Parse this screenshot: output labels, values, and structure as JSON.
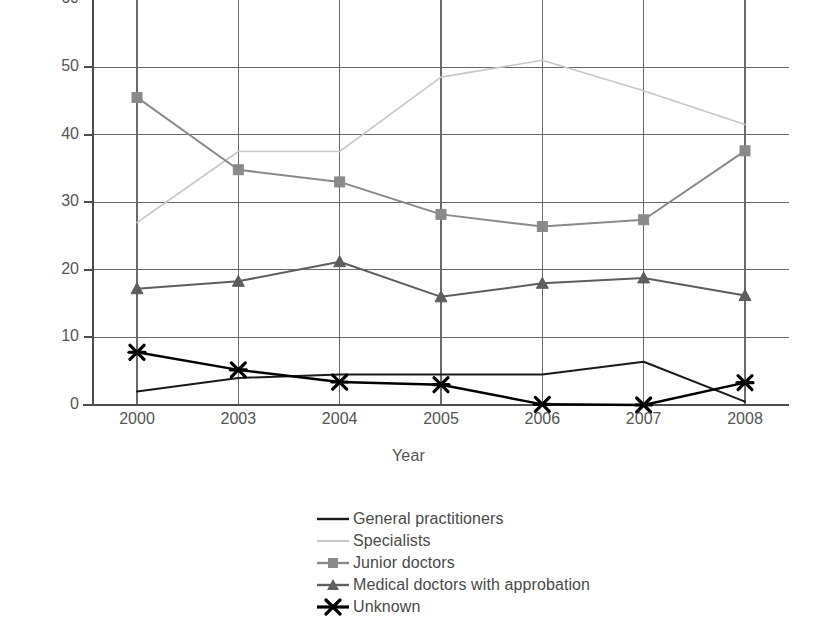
{
  "chart_data": {
    "type": "line",
    "title": "",
    "xlabel": "Year",
    "ylabel": "Percentage",
    "categories": [
      "2000",
      "2003",
      "2004",
      "2005",
      "2006",
      "2007",
      "2008"
    ],
    "ylim": [
      0,
      60
    ],
    "yticks": [
      0,
      10,
      20,
      30,
      40,
      50,
      60
    ],
    "ytick_labels": [
      "0",
      "10",
      "20",
      "30",
      "40",
      "50",
      "60"
    ],
    "grid": true,
    "grid_axis": "both",
    "legend_position": "bottom-center",
    "series": [
      {
        "name": "General practitioners",
        "color": "#1a1a1a",
        "marker": "none",
        "line_width": 2.0,
        "values": [
          2.0,
          4.0,
          4.5,
          4.5,
          4.5,
          6.4,
          0.5
        ]
      },
      {
        "name": "Specialists",
        "color": "#c8c8c8",
        "marker": "none",
        "line_width": 1.6,
        "values": [
          27.0,
          37.5,
          37.5,
          48.5,
          51.0,
          46.5,
          41.5
        ]
      },
      {
        "name": "Junior doctors",
        "color": "#8a8a8a",
        "marker": "square",
        "line_width": 2.0,
        "values": [
          45.5,
          34.8,
          33.0,
          28.2,
          26.4,
          27.4,
          37.6
        ]
      },
      {
        "name": "Medical doctors with approbation",
        "color": "#5e5e5e",
        "marker": "triangle",
        "line_width": 2.0,
        "values": [
          17.2,
          18.3,
          21.2,
          16.0,
          18.0,
          18.8,
          16.2
        ]
      },
      {
        "name": "Unknown",
        "color": "#000000",
        "marker": "x",
        "line_width": 2.4,
        "values": [
          7.8,
          5.2,
          3.4,
          3.0,
          0.1,
          0.0,
          3.3
        ]
      }
    ]
  },
  "axis": {
    "y_title": "Percentage",
    "x_title": "Year"
  },
  "colors": {
    "axis_line": "#4d4d4d",
    "grid_line": "#6a6a6a",
    "tick_text": "#555555",
    "background": "#ffffff"
  }
}
